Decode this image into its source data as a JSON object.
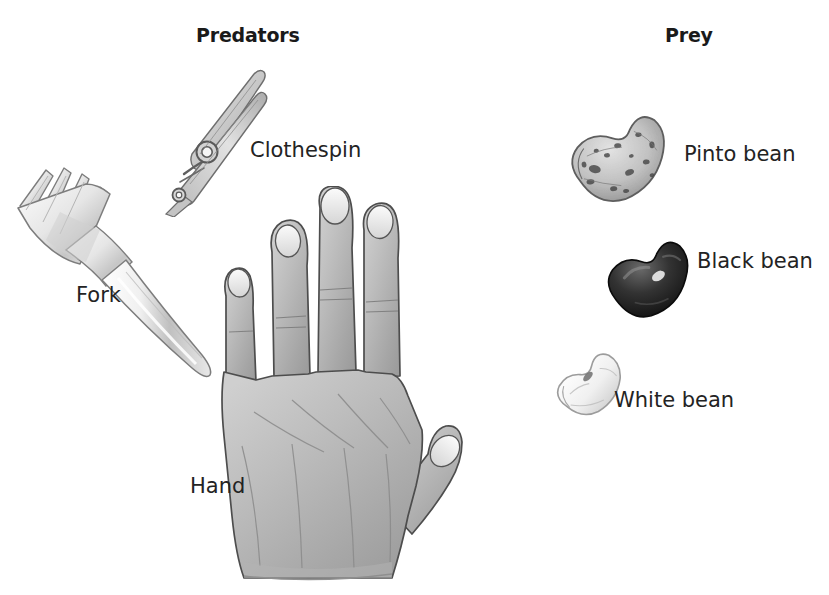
{
  "figure": {
    "background_color": "#ffffff",
    "width": 829,
    "height": 595,
    "columns": [
      {
        "id": "predators",
        "heading": "Predators"
      },
      {
        "id": "prey",
        "heading": "Prey"
      }
    ]
  },
  "headings": {
    "predators": "Predators",
    "prey": "Prey"
  },
  "predators": [
    {
      "label": "Fork",
      "icon": "fork-illustration",
      "style": "pencil-sketch",
      "colors": {
        "outline": "#6b6b6b",
        "fill_light": "#fbfbfb",
        "fill_shade": "#c9c9c9"
      }
    },
    {
      "label": "Clothespin",
      "icon": "clothespin-illustration",
      "style": "pencil-sketch",
      "colors": {
        "outline": "#707070",
        "fill_light": "#e4e4e4",
        "fill_shade": "#a8a8a8"
      }
    },
    {
      "label": "Hand",
      "icon": "hand-illustration",
      "style": "pencil-sketch",
      "colors": {
        "outline": "#4a4a4a",
        "fill_light": "#c4c4c4",
        "fill_shade": "#8f8f8f"
      }
    }
  ],
  "prey": [
    {
      "label": "Pinto bean",
      "icon": "pinto-bean-illustration",
      "style": "pencil-sketch",
      "colors": {
        "outline": "#5e5e5e",
        "fill_light": "#d8d8d8",
        "fill_shade": "#9a9a9a",
        "speckle": "#3f3f3f"
      }
    },
    {
      "label": "Black bean",
      "icon": "black-bean-illustration",
      "style": "pencil-sketch",
      "colors": {
        "outline": "#1a1a1a",
        "fill_light": "#5a5a5a",
        "fill_shade": "#141414",
        "highlight": "#e8e8e8"
      }
    },
    {
      "label": "White bean",
      "icon": "white-bean-illustration",
      "style": "pencil-sketch",
      "colors": {
        "outline": "#9a9a9a",
        "fill_light": "#fdfdfd",
        "fill_shade": "#d5d5d5"
      }
    }
  ]
}
